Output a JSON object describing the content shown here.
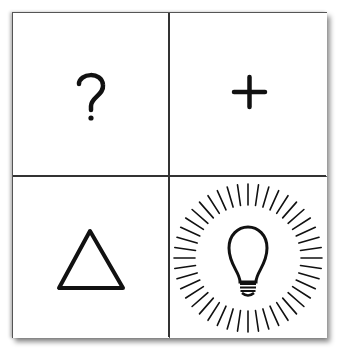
{
  "grid": {
    "rows": 2,
    "cols": 2,
    "cells": [
      {
        "position": "top-left",
        "icon": "question-mark-icon",
        "glyph": "?"
      },
      {
        "position": "top-right",
        "icon": "plus-icon",
        "glyph": "+"
      },
      {
        "position": "bottom-left",
        "icon": "triangle-icon",
        "glyph": "△"
      },
      {
        "position": "bottom-right",
        "icon": "lightbulb-burst-icon",
        "glyph": "💡"
      }
    ]
  },
  "colors": {
    "stroke": "#111111",
    "background": "#ffffff",
    "border": "#555555"
  }
}
